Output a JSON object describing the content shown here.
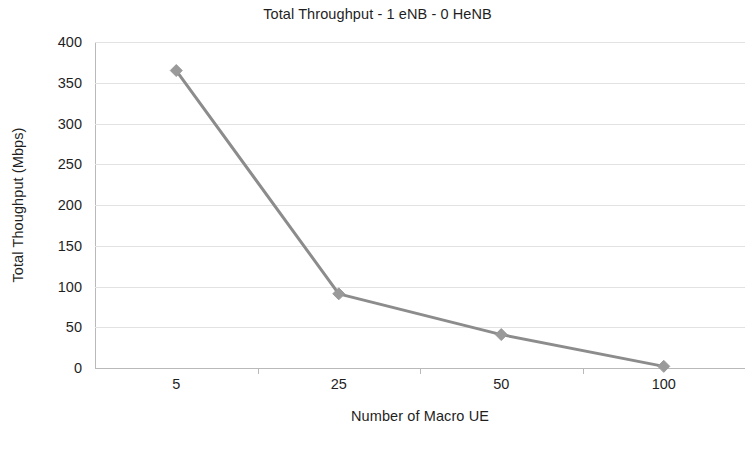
{
  "chart_data": {
    "type": "line",
    "title": "Total Throughput - 1 eNB - 0 HeNB",
    "xlabel": "Number of Macro UE",
    "ylabel": "Total Thoughput (Mbps)",
    "categories": [
      "5",
      "25",
      "50",
      "100"
    ],
    "values": [
      365,
      91,
      41,
      2
    ],
    "series": [
      {
        "name": "Total Throughput",
        "values": [
          365,
          91,
          41,
          2
        ],
        "color": "#8c8c8c",
        "marker": "diamond",
        "marker_color": "#9a9a9a"
      }
    ],
    "ylim": [
      0,
      400
    ],
    "yticks": [
      0,
      50,
      100,
      150,
      200,
      250,
      300,
      350,
      400
    ],
    "ytick_labels": [
      "0",
      "50",
      "100",
      "150",
      "200",
      "250",
      "300",
      "350",
      "400"
    ],
    "grid": "horizontal",
    "legend": "none",
    "background": "#ffffff",
    "gridline_color": "#e2e2e2",
    "axis_color": "#b9b9b9",
    "text_color": "#1f1f1f"
  }
}
